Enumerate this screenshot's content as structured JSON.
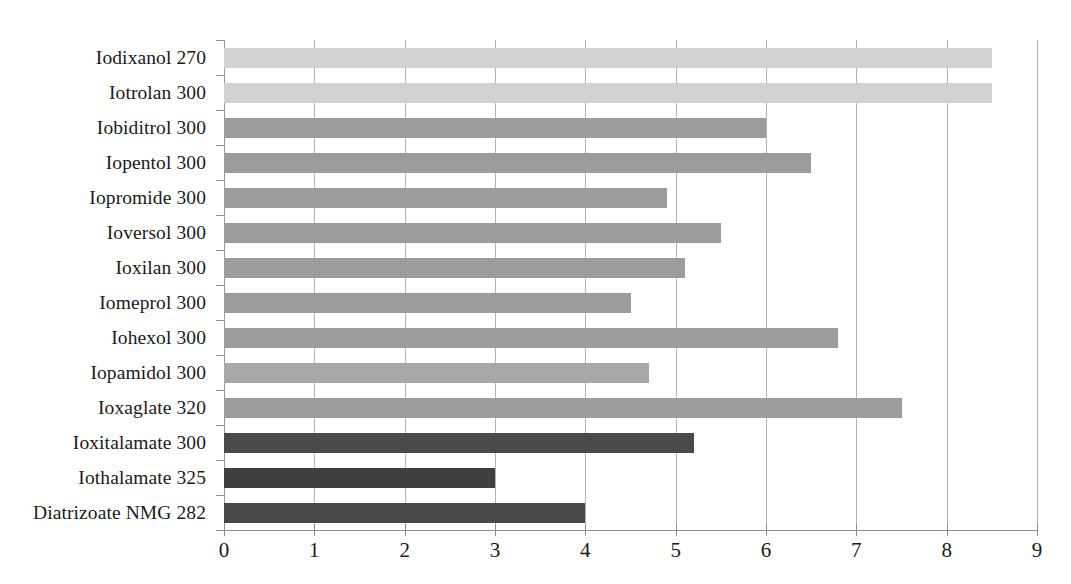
{
  "chart_data": {
    "type": "bar",
    "orientation": "horizontal",
    "title": "",
    "subtitle": "",
    "xlabel": "",
    "ylabel": "",
    "xlim": [
      0,
      9
    ],
    "ylim": null,
    "grid": true,
    "legend": null,
    "xticks": [
      "0",
      "1",
      "2",
      "3",
      "4",
      "5",
      "6",
      "7",
      "8",
      "9"
    ],
    "categories": [
      "Iodixanol 270",
      "Iotrolan 300",
      "Iobiditrol 300",
      "Iopentol 300",
      "Iopromide 300",
      "Ioversol 300",
      "Ioxilan 300",
      "Iomeprol 300",
      "Iohexol 300",
      "Iopamidol 300",
      "Ioxaglate 320",
      "Ioxitalamate  300",
      "Iothalamate 325",
      "Diatrizoate NMG 282"
    ],
    "values": [
      8.5,
      8.5,
      6.0,
      6.5,
      4.9,
      5.5,
      5.1,
      4.5,
      6.8,
      4.7,
      7.5,
      5.2,
      3.0,
      4.0
    ],
    "bar_colors": [
      "#d2d2d2",
      "#d2d2d2",
      "#9c9c9c",
      "#9c9c9c",
      "#9c9c9c",
      "#9c9c9c",
      "#9c9c9c",
      "#9c9c9c",
      "#9c9c9c",
      "#a8a8a8",
      "#9c9c9c",
      "#4a4a4a",
      "#3f3f3f",
      "#484848"
    ],
    "colors": {
      "light_group": "#d2d2d2",
      "mid_group": "#9c9c9c",
      "dark_group": "#4a4a4a",
      "gridline": "#b4b4b4",
      "axis": "#8c8c8c",
      "text": "#1a1a1a",
      "background": "#ffffff"
    }
  }
}
